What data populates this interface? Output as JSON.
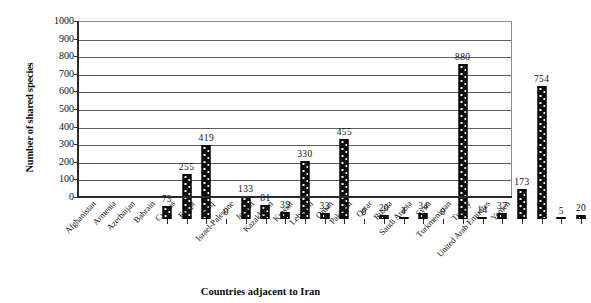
{
  "chart_data": {
    "type": "bar",
    "title": "",
    "xlabel": "Countries adjacent to Iran",
    "ylabel": "Number of shared species",
    "ylim": [
      0,
      1000
    ],
    "ytick_step": 100,
    "grid": true,
    "legend": "none",
    "yticks": [
      "1000",
      "900",
      "800",
      "700",
      "600",
      "500",
      "400",
      "300",
      "200",
      "100",
      "0"
    ],
    "categories": [
      "Afghanistan",
      "Armenia",
      "Azerbaijan",
      "Bahrain",
      "Cyprus",
      "Egypt",
      "Iraq",
      "Israel-Palestine",
      "Jordan",
      "Kazakhstan",
      "Kuwait",
      "Lebanon",
      "Oman",
      "Pakistan",
      "Qatar",
      "Russia",
      "Saudi Arabia",
      "Syria",
      "Turkmenistan",
      "Turkey",
      "United Arab Emirates",
      "Yemen"
    ],
    "values": [
      73,
      255,
      419,
      0,
      133,
      81,
      39,
      330,
      33,
      455,
      0,
      20,
      4,
      34,
      0,
      880,
      14,
      37,
      173,
      754,
      5,
      20
    ],
    "value_labels": [
      "73",
      "255",
      "419",
      "0",
      "133",
      "81",
      "39",
      "330",
      "33",
      "455",
      "0",
      "20",
      "4",
      "34",
      "0",
      "880",
      "14",
      "37",
      "173",
      "754",
      "5",
      "20"
    ],
    "bar_color": "#0d0d0d",
    "bar_pattern": "dotted-fill",
    "grid_color": "#5d5d5d",
    "axis_color": "#2b2b2b"
  }
}
